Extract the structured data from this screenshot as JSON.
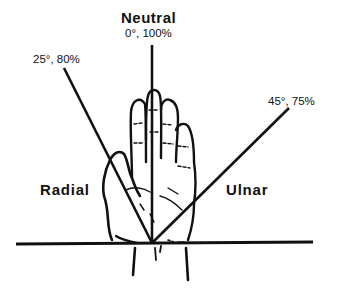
{
  "diagram": {
    "title": "Neutral",
    "positions": {
      "neutral": {
        "label": "0°, 100%",
        "angle_deg": 0,
        "percent": 100
      },
      "radial": {
        "label": "25°, 80%",
        "angle_deg": 25,
        "percent": 80
      },
      "ulnar": {
        "label": "45°, 75%",
        "angle_deg": 45,
        "percent": 75
      }
    },
    "regions": {
      "radial": "Radial",
      "ulnar": "Ulnar"
    },
    "colors": {
      "line": "#111111",
      "background": "#ffffff"
    }
  }
}
